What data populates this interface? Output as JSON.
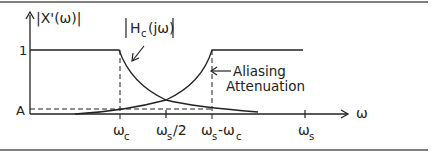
{
  "figure": {
    "y_axis_label": "|X'(ω)|",
    "x_axis_label": "ω",
    "y_ticks": [
      {
        "label": "1"
      },
      {
        "label": "A"
      }
    ],
    "x_ticks": [
      {
        "main": "ω",
        "sub": "c"
      },
      {
        "main": "ω",
        "sub": "s",
        "suffix": "/2"
      },
      {
        "main": "ω",
        "sub": "s",
        "mid": "-ω",
        "sub2": "c"
      },
      {
        "main": "ω",
        "sub": "s"
      }
    ],
    "annotations": {
      "filter_label_main": "H",
      "filter_label_sub": "c",
      "filter_label_rest": "(jω)",
      "aliasing_line1": "Aliasing",
      "aliasing_line2": "Attenuation"
    },
    "colors": {
      "line": "#222222",
      "rule": "#555555"
    }
  }
}
